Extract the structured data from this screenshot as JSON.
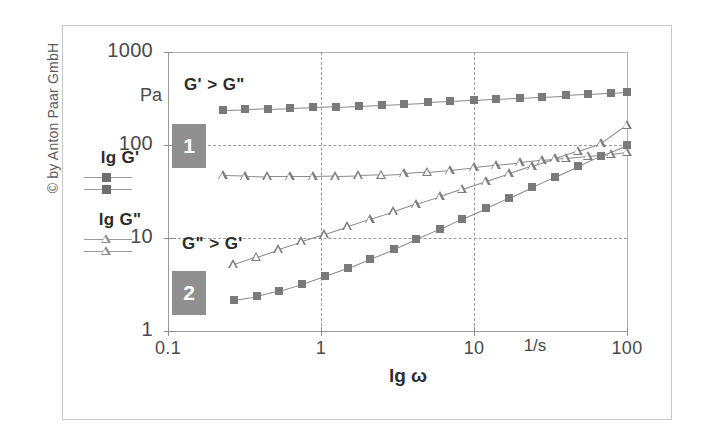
{
  "copyright": "© by Anton Paar GmbH",
  "legend": {
    "series1_label": "lg G'",
    "series2_label": "lg G\"",
    "marker1": "filled-square",
    "marker2": "open-triangle"
  },
  "annotations": {
    "region_top": "G' > G\"",
    "region_bottom": "G\" > G'",
    "sample1": "1",
    "sample2": "2"
  },
  "colors": {
    "marker_fill": "#7a7a7a",
    "line": "#8a8a8a",
    "grid": "#9a9a9a",
    "axis": "#8d8d8d",
    "box_fill": "#8f8f8f",
    "frame": "#c9c9c9",
    "text": "#3a3a3a"
  },
  "chart_data": {
    "type": "line",
    "title": "",
    "xlabel": "lg ω",
    "ylabel": "Pa",
    "x_unit": "1/s",
    "xscale": "log",
    "yscale": "log",
    "xlim": [
      0.1,
      100
    ],
    "ylim": [
      1,
      1000
    ],
    "xticks": [
      0.1,
      1,
      10,
      100
    ],
    "xticklabels": [
      "0.1",
      "1",
      "10",
      "100"
    ],
    "yticks": [
      1,
      10,
      100,
      1000
    ],
    "yticklabels": [
      "1",
      "10",
      "100",
      "1000"
    ],
    "grid": "dashed at x=1, x=10, y=10, y=100",
    "legend_position": "outside-left",
    "annotations": [
      {
        "text": "G' > G\"",
        "x": 0.35,
        "y": 520
      },
      {
        "text": "G\" > G'",
        "x": 0.33,
        "y": 11.5
      },
      {
        "text": "1",
        "x": 0.2,
        "y": 100
      },
      {
        "text": "2",
        "x": 0.2,
        "y": 3.2
      }
    ],
    "series": [
      {
        "name": "lg G' (sample 1)",
        "marker": "filled-square",
        "sample": 1,
        "x": [
          0.23,
          0.32,
          0.45,
          0.63,
          0.89,
          1.25,
          1.77,
          2.5,
          3.5,
          5.0,
          7.0,
          10.0,
          14.0,
          20.0,
          28.0,
          40.0,
          56.0,
          79.0,
          100.0
        ],
        "y": [
          238,
          241,
          245,
          249,
          254,
          259,
          265,
          272,
          279,
          287,
          295,
          304,
          313,
          322,
          332,
          342,
          352,
          362,
          372
        ]
      },
      {
        "name": "lg G\" (sample 1)",
        "marker": "open-triangle",
        "sample": 1,
        "x": [
          0.23,
          0.32,
          0.45,
          0.63,
          0.89,
          1.25,
          1.77,
          2.5,
          3.5,
          5.0,
          7.0,
          10.0,
          14.0,
          20.0,
          28.0,
          40.0,
          56.0,
          79.0,
          100.0
        ],
        "y": [
          47,
          46.5,
          46,
          46,
          46,
          46.5,
          47,
          48,
          49.5,
          51.5,
          54,
          57.5,
          61,
          65,
          69,
          73,
          77,
          81,
          85
        ]
      },
      {
        "name": "lg G'' (sample 2)",
        "marker": "open-triangle",
        "sample": 2,
        "x": [
          0.27,
          0.38,
          0.53,
          0.75,
          1.06,
          1.5,
          2.1,
          3.0,
          4.2,
          6.0,
          8.4,
          12.0,
          17.0,
          24.0,
          34.0,
          48.0,
          68.0,
          100.0
        ],
        "y": [
          5.2,
          6.3,
          7.6,
          9.2,
          11.0,
          13.3,
          16.0,
          19.3,
          23.3,
          28.1,
          33.9,
          41.0,
          49.4,
          59.6,
          71.9,
          86.8,
          104.7,
          165.0
        ]
      },
      {
        "name": "lg G' (sample 2)",
        "marker": "filled-square",
        "sample": 2,
        "x": [
          0.27,
          0.38,
          0.53,
          0.75,
          1.06,
          1.5,
          2.1,
          3.0,
          4.2,
          6.0,
          8.4,
          12.0,
          17.0,
          24.0,
          34.0,
          48.0,
          68.0,
          100.0
        ],
        "y": [
          2.15,
          2.35,
          2.7,
          3.2,
          3.9,
          4.8,
          6.0,
          7.6,
          9.7,
          12.5,
          16.2,
          21.0,
          27.2,
          35.3,
          45.8,
          59.4,
          77.0,
          100.0
        ]
      }
    ]
  }
}
